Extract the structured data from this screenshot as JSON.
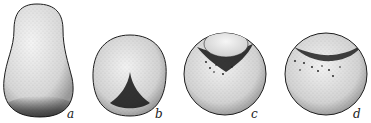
{
  "figure": {
    "colors": {
      "background": "#ffffff",
      "outline": "#1e1e1e",
      "stipple": "#2a2a2a",
      "dark_region": "#111111"
    },
    "panels": [
      {
        "id": "a",
        "label": "a",
        "shape": "pear-shaped egg with dark basal region"
      },
      {
        "id": "b",
        "label": "b",
        "shape": "rounded egg with dark triangular ventral region"
      },
      {
        "id": "c",
        "label": "c",
        "shape": "sphere with dark crescent band beneath a cap"
      },
      {
        "id": "d",
        "label": "d",
        "shape": "sphere with dark arched band near top"
      }
    ]
  }
}
